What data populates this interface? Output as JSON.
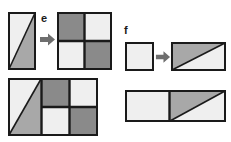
{
  "page": {
    "background": "#ffffff",
    "width": 231,
    "height": 142
  },
  "palette": {
    "light": "#efefef",
    "medium_gray": "#a8a8a8",
    "dark_gray": "#8a8a8a",
    "outline": "#1a1a1a",
    "arrow": "#6e6e6e",
    "label_color": "#1a1a1a"
  },
  "labels": {
    "e": "e",
    "f": "f"
  },
  "icons": {
    "arrow": "arrow-right-icon"
  },
  "figures": {
    "e_row": {
      "name": "figure-e",
      "label": "e",
      "source_tile": {
        "name": "diagonal-split-rectangle",
        "shape": "rectangle",
        "split": "diagonal-bottom-left-to-top-right",
        "upper_left_fill": "#efefef",
        "lower_right_fill": "#a8a8a8"
      },
      "target_tile": {
        "name": "checkerboard-square",
        "shape": "square",
        "grid": "2x2",
        "cells": [
          {
            "position": "top-left",
            "fill": "#8a8a8a"
          },
          {
            "position": "top-right",
            "fill": "#efefef"
          },
          {
            "position": "bottom-left",
            "fill": "#efefef"
          },
          {
            "position": "bottom-right",
            "fill": "#8a8a8a"
          }
        ]
      },
      "combined": {
        "name": "combined-figure-e",
        "left_panel": "diagonal-split-rectangle",
        "right_panel": "checkerboard-square"
      }
    },
    "f_row": {
      "name": "figure-f",
      "label": "f",
      "source_tile": {
        "name": "plain-square",
        "shape": "square",
        "fill": "#efefef"
      },
      "target_tile": {
        "name": "diagonal-split-wide-rectangle",
        "shape": "rectangle",
        "split": "diagonal-bottom-left-to-top-right",
        "upper_left_fill": "#a8a8a8",
        "lower_right_fill": "#efefef"
      },
      "combined": {
        "name": "combined-figure-f",
        "left_panel": "plain-square",
        "right_panel": "diagonal-split-wide-rectangle"
      }
    }
  }
}
